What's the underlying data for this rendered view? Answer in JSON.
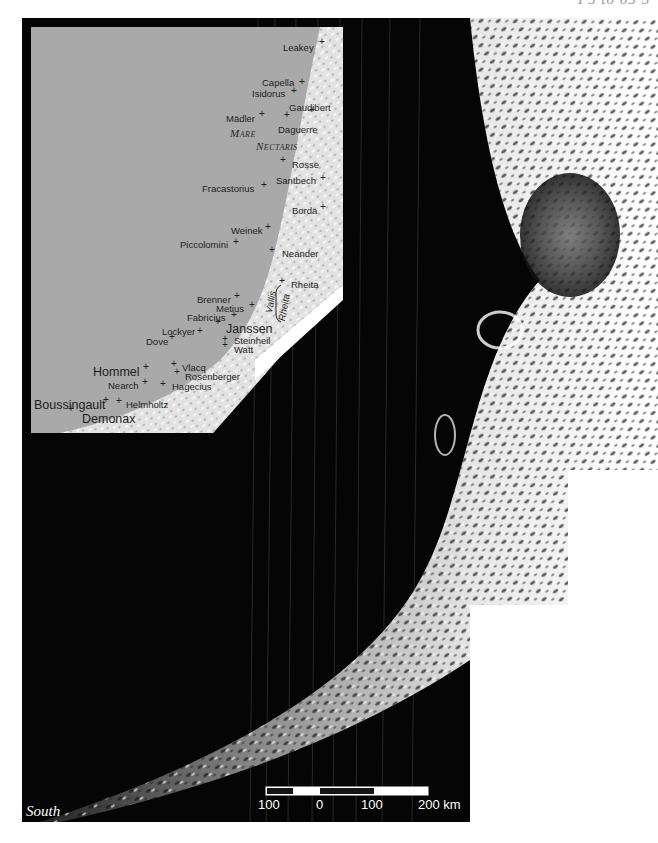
{
  "page": {
    "corner_label": "P5 to 65 S",
    "corner_label_note": "partially clipped at top edge"
  },
  "map": {
    "orientation_label": "South",
    "scale_bar": {
      "ticks": [
        "100",
        "0",
        "100",
        "200 km"
      ],
      "segments": [
        "dark",
        "light",
        "dark",
        "light"
      ]
    },
    "inset": {
      "region_labels": {
        "mare_line1": "Mare",
        "mare_line2": "Nectaris",
        "vallis_line1": "Vallis",
        "vallis_line2": "Rheita"
      },
      "craters": [
        {
          "name": "Leakey",
          "x": 283,
          "y": 43,
          "plus_x": 322,
          "plus_y": 42,
          "size": "normal"
        },
        {
          "name": "Capella",
          "x": 262,
          "y": 78,
          "plus_x": 302,
          "plus_y": 82,
          "size": "normal"
        },
        {
          "name": "Isidorus",
          "x": 252,
          "y": 89,
          "plus_x": 294,
          "plus_y": 91,
          "size": "normal"
        },
        {
          "name": "Gaudibert",
          "x": 289,
          "y": 103,
          "plus_x": 312,
          "plus_y": 110,
          "size": "normal"
        },
        {
          "name": "Mädler",
          "x": 226,
          "y": 114,
          "plus_x": 262,
          "plus_y": 114,
          "size": "normal"
        },
        {
          "name": "Daguerre",
          "x": 278,
          "y": 125,
          "plus_x": 287,
          "plus_y": 115,
          "size": "normal"
        },
        {
          "name": "Rosse",
          "x": 292,
          "y": 160,
          "plus_x": 283,
          "plus_y": 160,
          "size": "normal"
        },
        {
          "name": "Santbech",
          "x": 276,
          "y": 176,
          "plus_x": 323,
          "plus_y": 178,
          "size": "normal"
        },
        {
          "name": "Fracastorius",
          "x": 202,
          "y": 184,
          "plus_x": 264,
          "plus_y": 185,
          "size": "normal"
        },
        {
          "name": "Borda",
          "x": 292,
          "y": 206,
          "plus_x": 323,
          "plus_y": 207,
          "size": "normal"
        },
        {
          "name": "Weinek",
          "x": 231,
          "y": 226,
          "plus_x": 268,
          "plus_y": 227,
          "size": "normal"
        },
        {
          "name": "Piccolomini",
          "x": 180,
          "y": 240,
          "plus_x": 236,
          "plus_y": 242,
          "size": "normal"
        },
        {
          "name": "Neander",
          "x": 282,
          "y": 249,
          "plus_x": 272,
          "plus_y": 250,
          "size": "normal"
        },
        {
          "name": "Rheita",
          "x": 291,
          "y": 280,
          "plus_x": 282,
          "plus_y": 281,
          "size": "normal"
        },
        {
          "name": "Brenner",
          "x": 197,
          "y": 295,
          "plus_x": 237,
          "plus_y": 296,
          "size": "normal"
        },
        {
          "name": "Metius",
          "x": 216,
          "y": 304,
          "plus_x": 252,
          "plus_y": 305,
          "size": "normal"
        },
        {
          "name": "Fabricius",
          "x": 187,
          "y": 313,
          "plus_x": 234,
          "plus_y": 315,
          "size": "normal"
        },
        {
          "name": "Lockyer",
          "x": 162,
          "y": 327,
          "plus_x": 200,
          "plus_y": 331,
          "size": "normal"
        },
        {
          "name": "Janssen",
          "x": 226,
          "y": 323,
          "plus_x": 218,
          "plus_y": 322,
          "size": "big"
        },
        {
          "name": "Dove",
          "x": 146,
          "y": 337,
          "plus_x": 172,
          "plus_y": 337,
          "size": "normal"
        },
        {
          "name": "Steinheil",
          "x": 234,
          "y": 336,
          "plus_x": 225,
          "plus_y": 339,
          "size": "normal"
        },
        {
          "name": "Watt",
          "x": 234,
          "y": 345,
          "plus_x": 225,
          "plus_y": 345,
          "size": "normal"
        },
        {
          "name": "Vlacq",
          "x": 182,
          "y": 363,
          "plus_x": 174,
          "plus_y": 364,
          "size": "normal"
        },
        {
          "name": "Hommel",
          "x": 93,
          "y": 366,
          "plus_x": 146,
          "plus_y": 367,
          "size": "big"
        },
        {
          "name": "Rosenberger",
          "x": 185,
          "y": 372,
          "plus_x": 177,
          "plus_y": 372,
          "size": "normal"
        },
        {
          "name": "Nearch",
          "x": 108,
          "y": 381,
          "plus_x": 145,
          "plus_y": 382,
          "size": "normal"
        },
        {
          "name": "Hagecius",
          "x": 172,
          "y": 382,
          "plus_x": 163,
          "plus_y": 384,
          "size": "normal"
        },
        {
          "name": "Boussingault",
          "x": 34,
          "y": 399,
          "plus_x": 106,
          "plus_y": 400,
          "size": "big"
        },
        {
          "name": "Helmholtz",
          "x": 126,
          "y": 400,
          "plus_x": 119,
          "plus_y": 401,
          "size": "normal"
        },
        {
          "name": "Demonax",
          "x": 82,
          "y": 413,
          "plus_x": 71,
          "plus_y": 409,
          "size": "big"
        }
      ]
    }
  }
}
